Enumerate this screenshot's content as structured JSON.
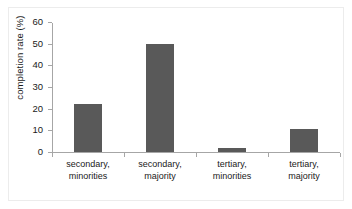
{
  "chart_data": {
    "type": "bar",
    "title": "",
    "xlabel": "",
    "ylabel": "completion rate (%)",
    "categories": [
      "secondary,\nminorities",
      "secondary,\nmajority",
      "tertiary,\nminorities",
      "tertiary,\nmajority"
    ],
    "category_lines": [
      [
        "secondary,",
        "minorities"
      ],
      [
        "secondary,",
        "majority"
      ],
      [
        "tertiary,",
        "minorities"
      ],
      [
        "tertiary,",
        "majority"
      ]
    ],
    "values": [
      22,
      50,
      2,
      10.5
    ],
    "ylim": [
      0,
      60
    ],
    "yticks": [
      0,
      10,
      20,
      30,
      40,
      50,
      60
    ],
    "ytick_labels": [
      "0",
      "10",
      "20",
      "30",
      "40",
      "50",
      "60"
    ],
    "grid": false,
    "legend": null,
    "bar_color": "#595959",
    "axis_color": "#a6a6a6",
    "background_color": "#ffffff",
    "frame_color": "#ececec"
  }
}
